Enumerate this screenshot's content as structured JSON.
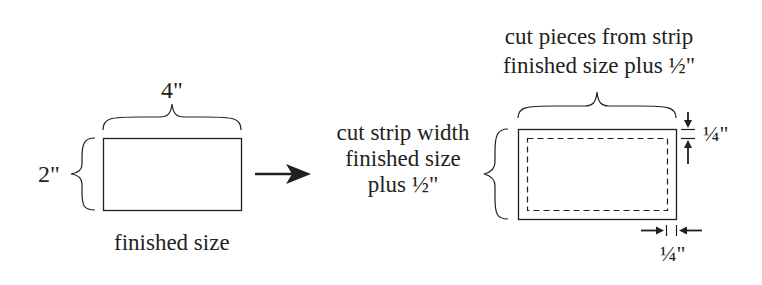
{
  "diagram": {
    "left": {
      "width_label": "4\"",
      "height_label": "2\"",
      "caption": "finished size"
    },
    "right": {
      "top_label_line1": "cut pieces from strip",
      "top_label_line2": "finished size plus ½\"",
      "side_label_line1": "cut strip width",
      "side_label_line2": "finished size",
      "side_label_line3": "plus ½\"",
      "seam_top_label": "¼\"",
      "seam_bottom_label": "¼\""
    },
    "colors": {
      "ink": "#231f20",
      "background": "#ffffff"
    }
  }
}
